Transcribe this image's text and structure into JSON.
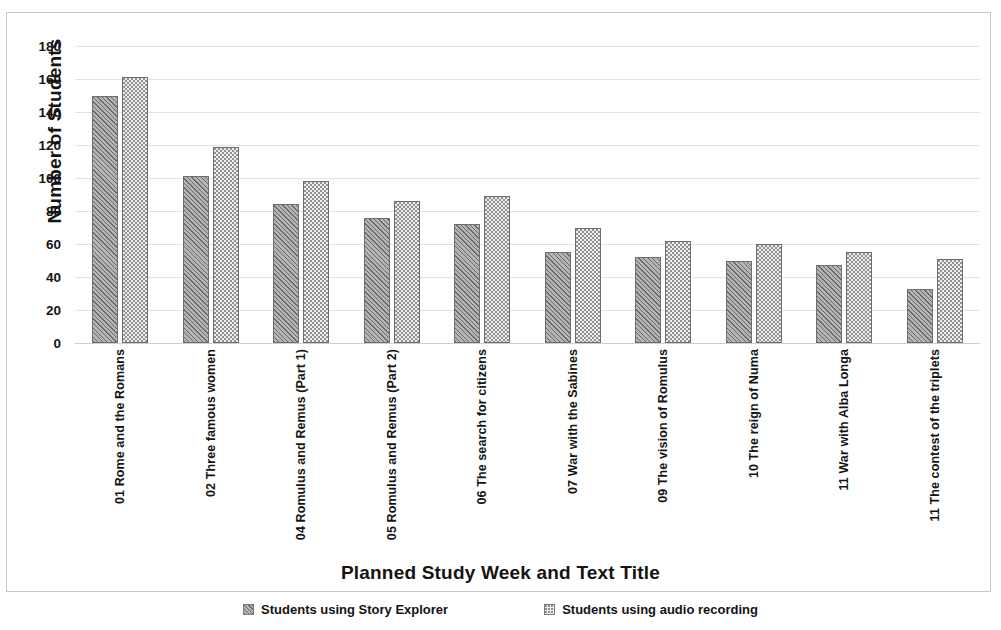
{
  "chart_data": {
    "type": "bar",
    "title": "",
    "xlabel": "Planned Study Week and Text Title",
    "ylabel": "Number of Students",
    "ylim": [
      0,
      180
    ],
    "yticks": [
      0,
      20,
      40,
      60,
      80,
      100,
      120,
      140,
      160,
      180
    ],
    "grid": true,
    "legend_position": "bottom",
    "categories": [
      "01 Rome and the Romans",
      "02 Three famous women",
      "04 Romulus and Remus (Part 1)",
      "05 Romulus and Remus (Part 2)",
      "06 The search for citizens",
      "07 War with the Sabines",
      "09 The vision of Romulus",
      "10 The reign of Numa",
      "11 War with Alba Longa",
      "11 The contest of the triplets"
    ],
    "series": [
      {
        "name": "Students using Story Explorer",
        "pattern": "diagonal-hatch",
        "values": [
          150,
          101,
          84,
          76,
          72,
          55,
          52,
          50,
          47,
          33
        ]
      },
      {
        "name": "Students using audio recording",
        "pattern": "dotted-stipple",
        "values": [
          161,
          119,
          98,
          86,
          89,
          70,
          62,
          60,
          55,
          51
        ]
      }
    ]
  }
}
